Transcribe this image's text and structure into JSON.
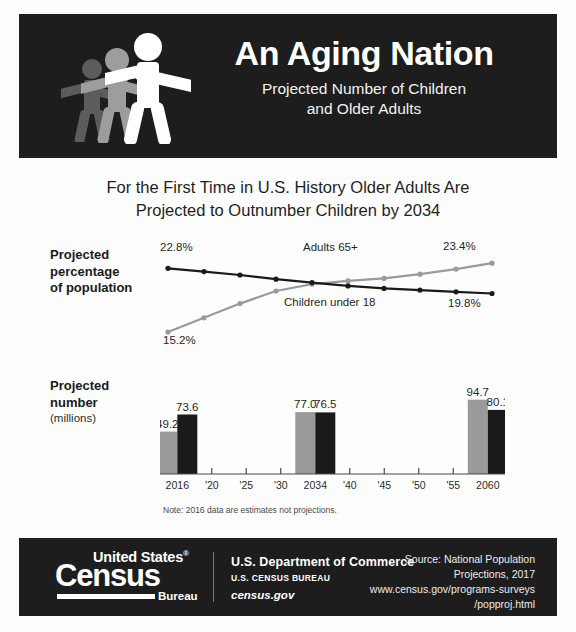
{
  "header": {
    "title": "An Aging Nation",
    "subtitle_line1": "Projected Number of Children",
    "subtitle_line2": "and Older Adults",
    "figure_icon": "three-people-icon",
    "bg_color": "#1d1d1d",
    "text_color": "#ffffff"
  },
  "headline": {
    "line1": "For the First Time in U.S. History Older Adults Are",
    "line2": "Projected to Outnumber Children by 2034"
  },
  "sections": {
    "percent": {
      "label_line1": "Projected",
      "label_line2": "percentage",
      "label_line3": "of population"
    },
    "number": {
      "label_line1": "Projected",
      "label_line2": "number",
      "label_line3": "(millions)"
    }
  },
  "note": "Note: 2016 data are estimates not projections.",
  "colors": {
    "adults_65_plus": "#9a9a9a",
    "children_under_18": "#1a1a1a",
    "axis": "#4a4a4a",
    "background": "#fdfdfd"
  },
  "chart_data": [
    {
      "type": "line",
      "title": "Projected percentage of population",
      "xlabel": "",
      "ylabel": "Projected percentage of population",
      "x": [
        2016,
        2020,
        2025,
        2030,
        2034,
        2040,
        2045,
        2050,
        2055,
        2060
      ],
      "ylim": [
        14.5,
        24.5
      ],
      "grid": false,
      "legend": "inline-annotations",
      "series": [
        {
          "name": "Adults 65+",
          "color": "#9a9a9a",
          "values": [
            15.2,
            16.9,
            18.6,
            20.1,
            20.9,
            21.3,
            21.6,
            22.1,
            22.7,
            23.4
          ],
          "start_label": "15.2%",
          "end_label": "23.4%"
        },
        {
          "name": "Children under 18",
          "color": "#1a1a1a",
          "values": [
            22.8,
            22.4,
            22.0,
            21.5,
            21.1,
            20.7,
            20.4,
            20.2,
            20.0,
            19.8
          ],
          "start_label": "22.8%",
          "end_label": "19.8%"
        }
      ],
      "annotations": [
        {
          "text": "Adults 65+"
        },
        {
          "text": "Children under 18"
        },
        {
          "text": "22.8%"
        },
        {
          "text": "23.4%"
        },
        {
          "text": "15.2%"
        },
        {
          "text": "19.8%"
        }
      ]
    },
    {
      "type": "bar",
      "title": "Projected number (millions)",
      "xlabel": "",
      "ylabel": "Projected number (millions)",
      "ylim": [
        0,
        100
      ],
      "grid": false,
      "categories": [
        "2016",
        "'20",
        "'25",
        "'30",
        "2034",
        "'40",
        "'45",
        "'50",
        "'55",
        "2060"
      ],
      "bar_years": [
        "2016",
        "2034",
        "2060"
      ],
      "series": [
        {
          "name": "Adults 65+",
          "color": "#9a9a9a",
          "values": [
            49.2,
            77.0,
            94.7
          ],
          "labels": [
            "49.2",
            "77.0",
            "94.7"
          ]
        },
        {
          "name": "Children under 18",
          "color": "#1a1a1a",
          "values": [
            73.6,
            76.5,
            80.1
          ],
          "labels": [
            "73.6",
            "76.5",
            "80.1"
          ]
        }
      ]
    }
  ],
  "footer": {
    "logo": {
      "united_states": "United States",
      "registered_mark": "®",
      "census": "Census",
      "bureau": "Bureau"
    },
    "department_line1": "U.S. Department of Commerce",
    "department_line2": "U.S. CENSUS BUREAU",
    "department_line3": "census.gov",
    "source_line1": "Source: National Population",
    "source_line2": "Projections, 2017",
    "source_line3": "www.census.gov/programs-surveys",
    "source_line4": "/popproj.html"
  }
}
